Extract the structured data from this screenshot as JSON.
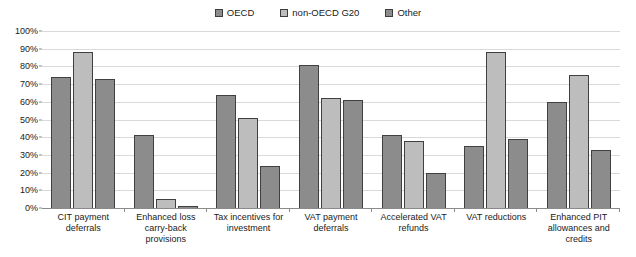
{
  "chart_data": {
    "type": "bar",
    "title": "",
    "subtitle": "",
    "xlabel": "",
    "ylabel": "",
    "ylim": [
      0,
      100
    ],
    "ytick_labels": [
      "100%",
      "90%",
      "80%",
      "70%",
      "60%",
      "50%",
      "40%",
      "30%",
      "20%",
      "10%",
      "0%"
    ],
    "ytick_values": [
      100,
      90,
      80,
      70,
      60,
      50,
      40,
      30,
      20,
      10,
      0
    ],
    "grid": "horizontal",
    "legend_position": "top-center",
    "value_suffix": "%",
    "categories": [
      "CIT payment deferrals",
      "Enhanced loss carry-back provisions",
      "Tax incentives for investment",
      "VAT payment deferrals",
      "Accelerated VAT refunds",
      "VAT reductions",
      "Enhanced PIT allowances and credits"
    ],
    "series": [
      {
        "name": "OECD",
        "color": "#8c8c8c",
        "values": [
          74,
          41,
          64,
          81,
          41,
          35,
          60
        ]
      },
      {
        "name": "non-OECD G20",
        "color": "#bdbdbd",
        "values": [
          88,
          5,
          51,
          62,
          38,
          88,
          75
        ]
      },
      {
        "name": "Other",
        "color": "#8c8c8c",
        "values": [
          73,
          1,
          24,
          61,
          20,
          39,
          33
        ]
      }
    ]
  },
  "style": {
    "bar_border": "#404040",
    "gridline": "#d9d9d9",
    "axis": "#8a8a8a",
    "text": "#1a1a1a",
    "background": "#ffffff"
  }
}
